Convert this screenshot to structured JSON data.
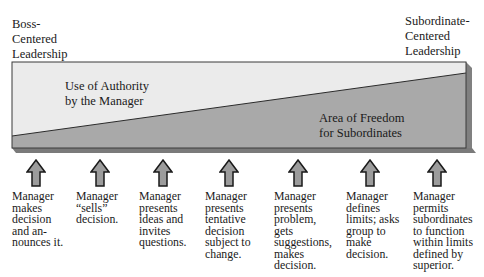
{
  "ends": {
    "left": {
      "lines": [
        "Boss-",
        "Centered",
        "Leadership"
      ]
    },
    "right": {
      "lines": [
        "Subordinate-",
        "Centered",
        "Leadership"
      ]
    }
  },
  "regions": {
    "authority": {
      "lines": [
        "Use of Authority",
        "by the Manager"
      ]
    },
    "freedom": {
      "lines": [
        "Area of Freedom",
        "for Subordinates"
      ]
    }
  },
  "colors": {
    "authority_fill": "#ebebeb",
    "freedom_fill": "#a9a9a9",
    "shadow": "#7a7a7a",
    "outline": "#2b2b2b",
    "arrow_fill": "#9c9c9c"
  },
  "steps": [
    {
      "lines": [
        "Manager",
        "makes",
        "decision",
        "and an-",
        "nounces it."
      ]
    },
    {
      "lines": [
        "Manager",
        "“sells”",
        "decision."
      ]
    },
    {
      "lines": [
        "Manager",
        "presents",
        "ideas and",
        "invites",
        "questions."
      ]
    },
    {
      "lines": [
        "Manager",
        "presents",
        "tentative",
        "decision",
        "subject to",
        "change."
      ]
    },
    {
      "lines": [
        "Manager",
        "presents",
        "problem,",
        "gets",
        "suggestions,",
        "makes",
        "decision."
      ]
    },
    {
      "lines": [
        "Manager",
        "defines",
        "limits; asks",
        "group to",
        "make",
        "decision."
      ]
    },
    {
      "lines": [
        "Manager",
        "permits",
        "subordinates",
        "to function",
        "within limits",
        "defined by",
        "superior."
      ]
    }
  ]
}
